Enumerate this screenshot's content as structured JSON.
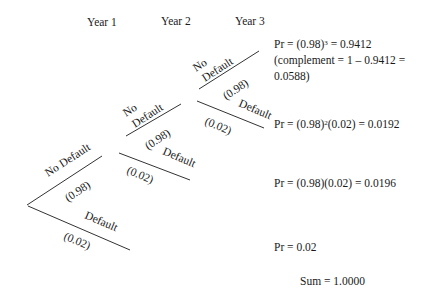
{
  "headers": [
    "Year 1",
    "Year 2",
    "Year 3"
  ],
  "branches": {
    "year1": {
      "up_label": "No Default",
      "up_prob": "(0.98)",
      "down_label": "Default",
      "down_prob": "(0.02)"
    },
    "year2": {
      "up_label_1": "No",
      "up_label_2": "Default",
      "up_prob": "(0.98)",
      "down_label": "Default",
      "down_prob": "(0.02)"
    },
    "year3": {
      "up_label_1": "No",
      "up_label_2": "Default",
      "up_prob": "(0.98)",
      "down_label": "Default",
      "down_prob": "(0.02)"
    }
  },
  "outcomes": {
    "o1_pre": "Pr = (0.98)",
    "o1_sup": "3",
    "o1_post": " = 0.9412",
    "o1_line2": "(complement = 1 – 0.9412 =",
    "o1_line3": "0.0588)",
    "o2_pre": "Pr = (0.98)",
    "o2_sup": "2",
    "o2_post": "(0.02) = 0.0192",
    "o3": "Pr = (0.98)(0.02) = 0.0196",
    "o4": "Pr = 0.02",
    "sum": "Sum = 1.0000"
  },
  "colors": {
    "line": "#333333",
    "text": "#1a1a1a",
    "background": "#ffffff"
  }
}
